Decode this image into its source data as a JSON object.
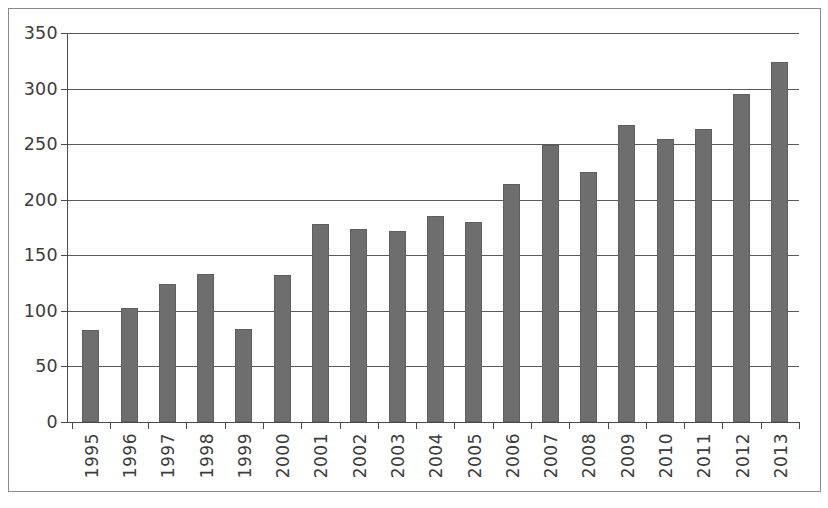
{
  "chart_data": {
    "type": "bar",
    "title": "",
    "subtitle": "",
    "xlabel": "",
    "ylabel": "",
    "categories": [
      "1995",
      "1996",
      "1997",
      "1998",
      "1999",
      "2000",
      "2001",
      "2002",
      "2003",
      "2004",
      "2005",
      "2006",
      "2007",
      "2008",
      "2009",
      "2010",
      "2011",
      "2012",
      "2013"
    ],
    "values": [
      83,
      103,
      124,
      133,
      84,
      132,
      178,
      174,
      172,
      185,
      180,
      214,
      249,
      225,
      267,
      255,
      264,
      295,
      324
    ],
    "series": [
      {
        "name": "",
        "values": [
          83,
          103,
          124,
          133,
          84,
          132,
          178,
          174,
          172,
          185,
          180,
          214,
          249,
          225,
          267,
          255,
          264,
          295,
          324
        ]
      }
    ],
    "ylim": [
      0,
      350
    ],
    "yticks": [
      0,
      50,
      100,
      150,
      200,
      250,
      300,
      350
    ],
    "ytick_labels": [
      "0",
      "50",
      "100",
      "150",
      "200",
      "250",
      "300",
      "350"
    ],
    "grid": true,
    "grid_axis": "y",
    "legend": false,
    "legend_position": "none",
    "bar_color": "#6e6e6e",
    "axis_color": "#4a4a4a",
    "grid_color": "#5a5a5a",
    "border_color": "#8a8a8a",
    "background_color": "#ffffff",
    "xtick_label_rotation": 90
  }
}
